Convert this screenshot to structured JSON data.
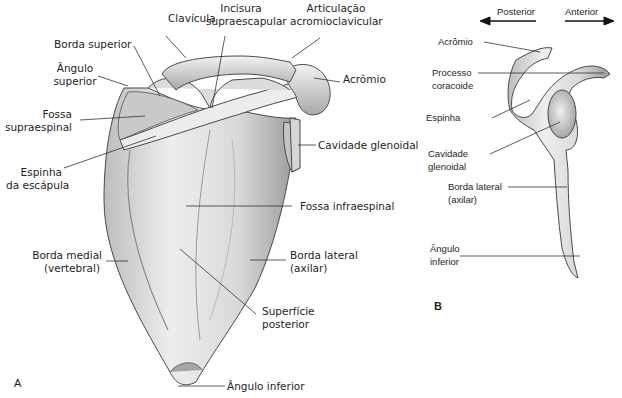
{
  "figure": {
    "panel_a": {
      "letter": "A",
      "labels": {
        "clavicula": "Clavícula",
        "incisura_1": "Incisura",
        "incisura_2": "supraescapular",
        "articulacao_1": "Articulação",
        "articulacao_2": "acromioclavicular",
        "borda_superior": "Borda superior",
        "angulo_superior_1": "Ângulo",
        "angulo_superior_2": "superior",
        "acromio": "Acrômio",
        "fossa_supra_1": "Fossa",
        "fossa_supra_2": "supraespinal",
        "cavidade_glenoidal": "Cavidade glenoidal",
        "espinha_1": "Espinha",
        "espinha_2": "da escápula",
        "fossa_infraespinal": "Fossa infraespinal",
        "borda_medial_1": "Borda medial",
        "borda_medial_2": "(vertebral)",
        "borda_lateral_1": "Borda lateral",
        "borda_lateral_2": "(axilar)",
        "superficie_1": "Superfície",
        "superficie_2": "posterior",
        "angulo_inferior": "Ângulo inferior"
      }
    },
    "panel_b": {
      "letter": "B",
      "direction": {
        "posterior": "Posterior",
        "anterior": "Anterior"
      },
      "labels": {
        "acromio": "Acrômio",
        "processo_1": "Processo",
        "processo_2": "coracoide",
        "espinha": "Espinha",
        "cavidade_1": "Cavidade",
        "cavidade_2": "glenoidal",
        "borda_lateral_1": "Borda lateral",
        "borda_lateral_2": "(axilar)",
        "angulo_1": "Ângulo",
        "angulo_2": "inferior"
      }
    },
    "colors": {
      "bone_fill": "#e6e6e6",
      "bone_shade": "#b5b5b5",
      "outline": "#4a4a4a",
      "leader": "#333333",
      "text": "#1e1e1e"
    }
  }
}
